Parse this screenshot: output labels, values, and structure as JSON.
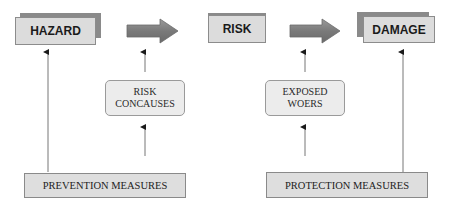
{
  "diagram": {
    "top_row": {
      "hazard": "HAZARD",
      "risk": "RISK",
      "damage": "DAMAGE"
    },
    "middle_row": {
      "left": [
        "RISK",
        "CONCAUSES"
      ],
      "right": [
        "EXPOSED",
        "WOERS"
      ]
    },
    "bottom_row": {
      "left": "PREVENTION MEASURES",
      "right": "PROTECTION MEASURES"
    },
    "colors": {
      "box_fill": "#dcdcdc",
      "box_shadow": "#8a8a8a",
      "arrow_fill": "#7f7f7f",
      "line": "#6e6e6e"
    }
  }
}
